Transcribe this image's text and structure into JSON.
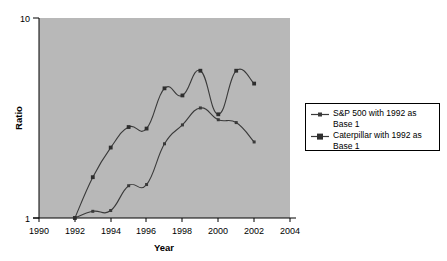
{
  "chart_data": {
    "type": "line",
    "title": "",
    "xlabel": "Year",
    "ylabel": "Ratio",
    "xlim": [
      1990,
      2004
    ],
    "ylim": [
      1,
      10
    ],
    "yscale": "log",
    "grid": false,
    "legend_position": "right",
    "x_ticks": [
      "1990",
      "1992",
      "1994",
      "1996",
      "1998",
      "2000",
      "2002",
      "2004"
    ],
    "y_ticks": [
      "1",
      "10"
    ],
    "x": [
      1992,
      1993,
      1994,
      1995,
      1996,
      1997,
      1998,
      1999,
      2000,
      2001,
      2002
    ],
    "series": [
      {
        "name": "S&P 500 with 1992 as Base 1",
        "marker": "square",
        "values": [
          1.0,
          1.08,
          1.09,
          1.45,
          1.47,
          2.35,
          2.92,
          3.55,
          3.1,
          3.0,
          2.4
        ]
      },
      {
        "name": "Caterpillar with 1992 as Base 1",
        "marker": "square",
        "values": [
          1.0,
          1.6,
          2.25,
          2.85,
          2.8,
          4.45,
          4.1,
          5.45,
          3.3,
          5.45,
          4.7
        ]
      }
    ]
  },
  "legend": {
    "entries": [
      {
        "label": "S&P 500 with 1992 as Base 1",
        "marker_name": "legend-marker-sp500"
      },
      {
        "label": "Caterpillar with 1992 as Base 1",
        "marker_name": "legend-marker-caterpillar"
      }
    ]
  },
  "colors": {
    "plot_background": "#b8b8b8",
    "page_background": "#ffffff",
    "line": "#3a3a3a",
    "axis": "#000000",
    "legend_border": "#000000"
  }
}
